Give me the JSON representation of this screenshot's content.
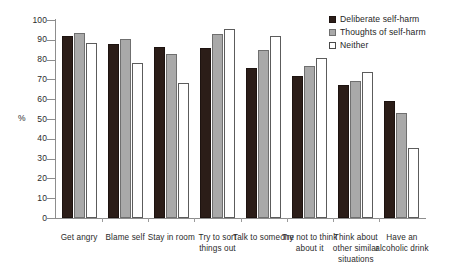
{
  "chart_data": {
    "type": "bar",
    "title": "",
    "xlabel": "",
    "ylabel": "%",
    "ylim": [
      0,
      100
    ],
    "ytick_step": 10,
    "yticks": [
      "100",
      "90",
      "80",
      "70",
      "60",
      "50",
      "40",
      "30",
      "20",
      "10",
      "0"
    ],
    "grid": false,
    "legend_position": "top-right",
    "categories": [
      "Get angry",
      "Blame self",
      "Stay in room",
      "Try to sort things out",
      "Talk to someone",
      "Try not to think about it",
      "Think about other similar situations",
      "Have an alcoholic drink"
    ],
    "series": [
      {
        "name": "Deliberate self-harm",
        "color": "#2b1d18",
        "values": [
          92,
          88,
          86.5,
          86,
          76,
          71.5,
          67,
          59
        ]
      },
      {
        "name": "Thoughts of self-harm",
        "color": "#a9a9a9",
        "values": [
          93.5,
          90.5,
          83,
          93,
          85,
          77,
          69,
          53
        ]
      },
      {
        "name": "Neither",
        "color": "#ffffff",
        "values": [
          88.5,
          78.5,
          68,
          95.5,
          92,
          81,
          73.5,
          35.5
        ]
      }
    ]
  },
  "legend": {
    "items": [
      {
        "label": "Deliberate self-harm"
      },
      {
        "label": "Thoughts of self-harm"
      },
      {
        "label": "Neither"
      }
    ]
  },
  "axes": {
    "y_title": "%"
  }
}
